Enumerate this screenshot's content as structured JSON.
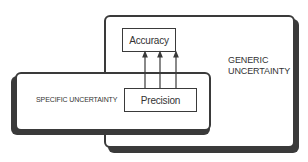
{
  "diagram": {
    "generic_box": {
      "label": "GENERIC\nUNCERTAINTY"
    },
    "specific_box": {
      "label": "SPECIFIC UNCERTAINTY"
    },
    "accuracy_box": {
      "label": "Accuracy"
    },
    "precision_box": {
      "label": "Precision"
    },
    "arrows": {
      "count": 3,
      "from": "Precision",
      "to": "Accuracy"
    },
    "colors": {
      "stroke": "#3a3a3a",
      "fill": "#ffffff",
      "text": "#333333"
    }
  }
}
